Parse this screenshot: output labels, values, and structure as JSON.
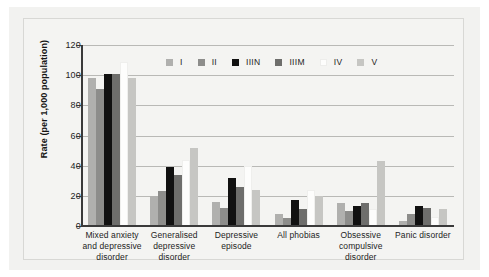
{
  "chart_data": {
    "type": "bar",
    "title": "",
    "xlabel": "",
    "ylabel": "Rate (per 1,000 population)",
    "ylim": [
      0,
      120
    ],
    "yticks": [
      0,
      20,
      40,
      60,
      80,
      100,
      120
    ],
    "grid": true,
    "legend_position": "top-center",
    "categories": [
      "Mixed anxiety and depressive disorder",
      "Generalised depressive disorder",
      "Depressive episode",
      "All phobias",
      "Obsessive compulsive disorder",
      "Panic disorder"
    ],
    "category_lines": [
      [
        "Mixed anxiety",
        "and depressive",
        "disorder"
      ],
      [
        "Generalised",
        "depressive",
        "disorder"
      ],
      [
        "Depressive",
        "episode"
      ],
      [
        "All phobias"
      ],
      [
        "Obsessive",
        "compulsive",
        "disorder"
      ],
      [
        "Panic disorder"
      ]
    ],
    "series": [
      {
        "name": "I",
        "color": "#b0b0ae",
        "values": [
          98,
          20,
          16,
          8,
          15,
          3
        ]
      },
      {
        "name": "II",
        "color": "#8d8d8b",
        "values": [
          91,
          23,
          12,
          5,
          10,
          8
        ]
      },
      {
        "name": "IIIN",
        "color": "#111111",
        "values": [
          101,
          39,
          32,
          17,
          13,
          13
        ]
      },
      {
        "name": "IIIM",
        "color": "#6e6e6c",
        "values": [
          101,
          34,
          26,
          11,
          15,
          12
        ]
      },
      {
        "name": "IV",
        "color": "#fdfdfc",
        "values": [
          109,
          44,
          40,
          24,
          11,
          6
        ]
      },
      {
        "name": "V",
        "color": "#c6c6c3",
        "values": [
          98,
          52,
          24,
          20,
          43,
          11
        ]
      }
    ]
  },
  "colors": {
    "page_background": "#f2f2f0",
    "plot_background": "#f4f4f2",
    "gridline": "#b9b9b6",
    "axis": "#3a3a3a",
    "text": "#1d1d1d"
  }
}
